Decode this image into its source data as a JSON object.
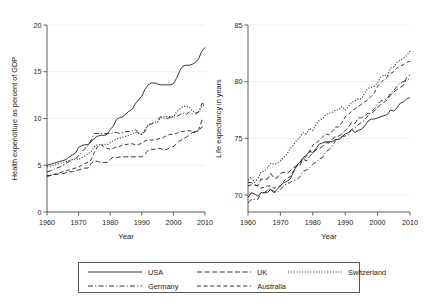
{
  "chart_data": [
    {
      "type": "line",
      "panel": "left",
      "title": "",
      "xlabel": "Year",
      "ylabel": "Health expenditure as percent of GDP",
      "xlim": [
        1960,
        2010
      ],
      "ylim": [
        0,
        20
      ],
      "xticks": [
        1960,
        1970,
        1980,
        1990,
        2000,
        2010
      ],
      "yticks": [
        0,
        5,
        10,
        15,
        20
      ],
      "grid": true,
      "legend_position": "below-figure",
      "x": [
        1960,
        1961,
        1962,
        1963,
        1964,
        1965,
        1966,
        1967,
        1968,
        1969,
        1970,
        1971,
        1972,
        1973,
        1974,
        1975,
        1976,
        1977,
        1978,
        1979,
        1980,
        1981,
        1982,
        1983,
        1984,
        1985,
        1986,
        1987,
        1988,
        1989,
        1990,
        1991,
        1992,
        1993,
        1994,
        1995,
        1996,
        1997,
        1998,
        1999,
        2000,
        2001,
        2002,
        2003,
        2004,
        2005,
        2006,
        2007,
        2008,
        2009,
        2010
      ],
      "series": [
        {
          "name": "USA",
          "dash": "solid",
          "values": [
            5.0,
            5.1,
            5.2,
            5.3,
            5.4,
            5.5,
            5.6,
            5.9,
            6.1,
            6.3,
            6.9,
            7.1,
            7.2,
            7.2,
            7.5,
            7.9,
            8.1,
            8.2,
            8.2,
            8.3,
            8.8,
            9.2,
            9.9,
            10.1,
            10.2,
            10.5,
            10.8,
            11.0,
            11.6,
            12.0,
            12.4,
            13.1,
            13.6,
            13.8,
            13.8,
            13.7,
            13.6,
            13.6,
            13.6,
            13.6,
            13.7,
            14.3,
            15.1,
            15.6,
            15.7,
            15.7,
            15.8,
            16.0,
            16.4,
            17.2,
            17.6
          ]
        },
        {
          "name": "UK",
          "dash": "dashed",
          "values": [
            3.9,
            3.9,
            4.0,
            4.0,
            4.1,
            4.1,
            4.2,
            4.3,
            4.3,
            4.4,
            4.5,
            4.6,
            4.7,
            4.7,
            5.2,
            5.5,
            5.4,
            5.3,
            5.3,
            5.3,
            5.6,
            5.9,
            5.8,
            5.9,
            5.9,
            5.9,
            5.9,
            5.9,
            5.9,
            5.9,
            5.9,
            6.2,
            6.6,
            6.7,
            6.7,
            6.8,
            6.8,
            6.6,
            6.7,
            6.9,
            7.0,
            7.3,
            7.6,
            7.8,
            8.0,
            8.2,
            8.5,
            8.5,
            8.8,
            9.8,
            9.6
          ]
        },
        {
          "name": "Switzerland",
          "dash": "dotted",
          "values": [
            4.9,
            4.9,
            5.0,
            5.1,
            5.2,
            5.3,
            5.4,
            5.5,
            5.6,
            5.7,
            5.6,
            5.8,
            6.0,
            6.2,
            6.5,
            7.0,
            7.2,
            7.2,
            7.2,
            7.2,
            7.4,
            7.6,
            7.8,
            7.9,
            8.0,
            8.1,
            8.2,
            8.4,
            8.5,
            8.4,
            8.3,
            8.8,
            9.3,
            9.5,
            9.5,
            9.6,
            10.1,
            10.2,
            10.2,
            10.2,
            10.2,
            10.7,
            11.0,
            11.3,
            11.3,
            11.2,
            10.8,
            10.6,
            10.7,
            11.3,
            11.5
          ]
        },
        {
          "name": "Germany",
          "dash": "dashdot",
          "values": [
            4.3,
            4.4,
            4.5,
            4.7,
            4.8,
            5.0,
            5.2,
            5.4,
            5.6,
            5.7,
            6.0,
            6.4,
            6.8,
            7.1,
            7.7,
            8.4,
            8.4,
            8.4,
            8.4,
            8.4,
            8.4,
            8.5,
            8.5,
            8.4,
            8.5,
            8.6,
            8.6,
            8.7,
            8.8,
            8.4,
            8.3,
            8.6,
            9.3,
            9.4,
            9.6,
            9.9,
            10.2,
            10.0,
            10.0,
            10.1,
            10.1,
            10.2,
            10.4,
            10.6,
            10.4,
            10.7,
            10.5,
            10.5,
            10.7,
            11.6,
            11.5
          ]
        },
        {
          "name": "Australia",
          "dash": "longdash",
          "values": [
            3.8,
            3.9,
            4.0,
            4.1,
            4.2,
            4.3,
            4.4,
            4.5,
            4.6,
            4.7,
            4.8,
            5.0,
            5.2,
            5.3,
            5.6,
            6.4,
            7.0,
            7.2,
            7.0,
            6.8,
            6.7,
            6.8,
            7.0,
            7.0,
            7.2,
            7.2,
            7.3,
            7.3,
            7.2,
            7.2,
            7.4,
            7.6,
            7.7,
            7.7,
            7.7,
            7.8,
            7.9,
            8.0,
            8.2,
            8.3,
            8.3,
            8.4,
            8.6,
            8.6,
            8.7,
            8.7,
            8.6,
            8.6,
            8.7,
            9.1,
            9.1
          ]
        }
      ]
    },
    {
      "type": "line",
      "panel": "right",
      "title": "",
      "xlabel": "Year",
      "ylabel": "Life expectancy in years",
      "xlim": [
        1960,
        2010
      ],
      "ylim": [
        68.5,
        85
      ],
      "xticks": [
        1960,
        1970,
        1980,
        1990,
        2000,
        2010
      ],
      "yticks": [
        70,
        75,
        80,
        85
      ],
      "grid": true,
      "legend_position": "below-figure",
      "x": [
        1960,
        1961,
        1962,
        1963,
        1964,
        1965,
        1966,
        1967,
        1968,
        1969,
        1970,
        1971,
        1972,
        1973,
        1974,
        1975,
        1976,
        1977,
        1978,
        1979,
        1980,
        1981,
        1982,
        1983,
        1984,
        1985,
        1986,
        1987,
        1988,
        1989,
        1990,
        1991,
        1992,
        1993,
        1994,
        1995,
        1996,
        1997,
        1998,
        1999,
        2000,
        2001,
        2002,
        2003,
        2004,
        2005,
        2006,
        2007,
        2008,
        2009,
        2010
      ],
      "series": [
        {
          "name": "USA",
          "dash": "solid",
          "values": [
            69.8,
            70.2,
            70.1,
            69.9,
            70.2,
            70.2,
            70.2,
            70.5,
            70.2,
            70.5,
            70.8,
            71.1,
            71.2,
            71.4,
            72.0,
            72.6,
            72.9,
            73.3,
            73.5,
            73.9,
            73.7,
            74.1,
            74.5,
            74.6,
            74.7,
            74.7,
            74.7,
            74.9,
            74.9,
            75.1,
            75.4,
            75.5,
            75.8,
            75.5,
            75.7,
            75.8,
            76.1,
            76.5,
            76.7,
            76.7,
            76.8,
            76.9,
            77.0,
            77.1,
            77.5,
            77.4,
            77.7,
            78.1,
            78.2,
            78.5,
            78.6
          ]
        },
        {
          "name": "UK",
          "dash": "dashed",
          "values": [
            71.1,
            71.1,
            70.9,
            70.8,
            71.4,
            71.4,
            71.4,
            71.9,
            71.5,
            71.5,
            71.9,
            72.0,
            71.9,
            72.1,
            72.4,
            72.6,
            72.6,
            73.2,
            73.0,
            73.4,
            73.7,
            74.0,
            74.1,
            74.3,
            74.6,
            74.6,
            74.9,
            75.2,
            75.2,
            75.4,
            75.7,
            76.0,
            76.4,
            76.3,
            76.8,
            76.8,
            77.0,
            77.2,
            77.2,
            77.4,
            77.7,
            78.0,
            78.2,
            78.4,
            78.8,
            79.1,
            79.3,
            79.5,
            79.7,
            80.4,
            80.6
          ]
        },
        {
          "name": "Switzerland",
          "dash": "dotted",
          "values": [
            71.3,
            71.6,
            71.1,
            71.4,
            72.0,
            72.1,
            72.4,
            72.8,
            72.7,
            72.8,
            73.0,
            73.3,
            73.6,
            74.1,
            74.4,
            74.8,
            75.1,
            75.5,
            75.4,
            75.9,
            75.7,
            76.2,
            76.6,
            76.7,
            77.1,
            77.2,
            77.3,
            77.5,
            77.5,
            77.8,
            77.5,
            77.8,
            78.2,
            78.3,
            78.5,
            78.5,
            79.0,
            79.4,
            79.5,
            79.6,
            79.9,
            80.4,
            80.6,
            80.5,
            81.2,
            81.3,
            81.7,
            81.9,
            82.1,
            82.3,
            82.7
          ]
        },
        {
          "name": "Germany",
          "dash": "dashdot",
          "values": [
            69.3,
            69.6,
            69.6,
            69.6,
            70.2,
            70.2,
            70.4,
            70.6,
            70.3,
            70.2,
            70.5,
            70.8,
            71.0,
            71.1,
            71.3,
            71.3,
            71.6,
            72.1,
            72.2,
            72.4,
            72.7,
            72.9,
            73.2,
            73.3,
            73.8,
            74.0,
            74.3,
            74.8,
            75.0,
            75.2,
            75.2,
            75.3,
            75.8,
            75.9,
            76.2,
            76.4,
            76.6,
            77.0,
            77.3,
            77.6,
            78.0,
            78.3,
            78.4,
            78.5,
            79.0,
            79.2,
            79.6,
            79.9,
            80.0,
            80.1,
            80.3
          ]
        },
        {
          "name": "Australia",
          "dash": "longdash",
          "values": [
            70.8,
            70.9,
            70.9,
            70.8,
            70.6,
            70.7,
            70.8,
            70.8,
            70.6,
            70.7,
            70.8,
            71.2,
            71.5,
            71.6,
            72.1,
            72.5,
            72.8,
            73.2,
            73.4,
            73.8,
            74.4,
            74.6,
            74.8,
            75.1,
            75.4,
            75.3,
            75.6,
            76.0,
            76.0,
            76.4,
            76.9,
            77.1,
            77.4,
            77.6,
            77.8,
            78.0,
            78.2,
            78.4,
            78.7,
            79.0,
            79.6,
            79.9,
            80.2,
            80.4,
            80.7,
            80.9,
            81.2,
            81.4,
            81.5,
            81.7,
            81.8
          ]
        }
      ]
    }
  ],
  "left_panel": {
    "ylabel": "Health expenditure as percent of GDP",
    "xlabel": "Year",
    "yticks": [
      "0",
      "5",
      "10",
      "15",
      "20"
    ],
    "xticks": [
      "1960",
      "1970",
      "1980",
      "1990",
      "2000",
      "2010"
    ]
  },
  "right_panel": {
    "ylabel": "Life expectancy in years",
    "xlabel": "Year",
    "yticks": [
      "70",
      "75",
      "80",
      "85"
    ],
    "xticks": [
      "1960",
      "1970",
      "1980",
      "1990",
      "2000",
      "2010"
    ]
  },
  "legend": {
    "items": [
      {
        "label": "USA",
        "dash": "solid"
      },
      {
        "label": "UK",
        "dash": "dashed"
      },
      {
        "label": "Switzerland",
        "dash": "dotted"
      },
      {
        "label": "Germany",
        "dash": "dashdot"
      },
      {
        "label": "Australia",
        "dash": "longdash"
      }
    ]
  }
}
